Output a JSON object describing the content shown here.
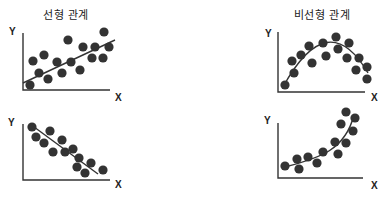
{
  "panels": [
    {
      "id": "linear-positive",
      "title": "선형 관계",
      "title_pos": [
        66,
        8
      ],
      "y_label": "Y",
      "x_label": "X",
      "axis": {
        "origin": [
          23,
          90
        ],
        "top": 33,
        "right": 110
      },
      "y_label_pos": [
        9,
        35
      ],
      "x_label_pos": [
        115,
        101
      ],
      "trend": "M23,83 L115,40",
      "points": [
        [
          30,
          85
        ],
        [
          33,
          61
        ],
        [
          39,
          73
        ],
        [
          44,
          55
        ],
        [
          48,
          79
        ],
        [
          57,
          62
        ],
        [
          62,
          73
        ],
        [
          68,
          40
        ],
        [
          71,
          62
        ],
        [
          80,
          70
        ],
        [
          83,
          47
        ],
        [
          92,
          58
        ],
        [
          95,
          47
        ],
        [
          103,
          58
        ],
        [
          104,
          32
        ],
        [
          109,
          47
        ]
      ]
    },
    {
      "id": "nonlinear-arch",
      "title": "비선형 관계",
      "title_pos": [
        322,
        8
      ],
      "y_label": "Y",
      "x_label": "X",
      "axis": {
        "origin": [
          278,
          92
        ],
        "top": 32,
        "right": 365
      },
      "y_label_pos": [
        265,
        37
      ],
      "x_label_pos": [
        371,
        101
      ],
      "trend": "M283,87 Q328,5 368,73",
      "points": [
        [
          285,
          85
        ],
        [
          294,
          73
        ],
        [
          292,
          61
        ],
        [
          301,
          55
        ],
        [
          309,
          46
        ],
        [
          312,
          63
        ],
        [
          323,
          43
        ],
        [
          326,
          56
        ],
        [
          336,
          37
        ],
        [
          338,
          49
        ],
        [
          349,
          43
        ],
        [
          347,
          58
        ],
        [
          359,
          58
        ],
        [
          356,
          70
        ],
        [
          367,
          67
        ],
        [
          367,
          79
        ]
      ]
    },
    {
      "id": "linear-negative",
      "title": "",
      "title_pos": [
        0,
        0
      ],
      "y_label": "Y",
      "x_label": "X",
      "axis": {
        "origin": [
          23,
          180
        ],
        "top": 124,
        "right": 110
      },
      "y_label_pos": [
        8,
        126
      ],
      "x_label_pos": [
        115,
        188
      ],
      "trend": "M30,124 L98,174",
      "points": [
        [
          32,
          127
        ],
        [
          36,
          137
        ],
        [
          50,
          131
        ],
        [
          44,
          143
        ],
        [
          62,
          140
        ],
        [
          53,
          152
        ],
        [
          65,
          152
        ],
        [
          73,
          149
        ],
        [
          79,
          158
        ],
        [
          77,
          167
        ],
        [
          91,
          163
        ],
        [
          85,
          173
        ],
        [
          103,
          170
        ]
      ]
    },
    {
      "id": "nonlinear-exponential",
      "title": "",
      "title_pos": [
        0,
        0
      ],
      "y_label": "Y",
      "x_label": "X",
      "axis": {
        "origin": [
          278,
          178
        ],
        "top": 123,
        "right": 363
      },
      "y_label_pos": [
        264,
        124
      ],
      "x_label_pos": [
        371,
        189
      ],
      "trend": "M285,167 C320,158 345,150 354,115",
      "points": [
        [
          285,
          166
        ],
        [
          297,
          159
        ],
        [
          299,
          169
        ],
        [
          308,
          157
        ],
        [
          317,
          163
        ],
        [
          323,
          152
        ],
        [
          335,
          142
        ],
        [
          338,
          154
        ],
        [
          346,
          143
        ],
        [
          341,
          124
        ],
        [
          353,
          131
        ],
        [
          346,
          112
        ],
        [
          355,
          118
        ]
      ]
    }
  ],
  "style": {
    "dot_color": "#333333",
    "line_color": "#333333",
    "axis_color": "#333333",
    "dot_radius": 4.6
  }
}
